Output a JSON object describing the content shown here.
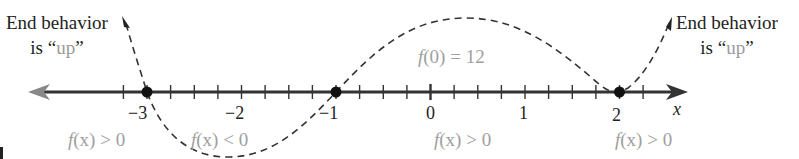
{
  "diagram": {
    "axis": {
      "variable": "x",
      "tick_labels": [
        "−3",
        "−2",
        "−1",
        "0",
        "1",
        "2"
      ],
      "tick_values": [
        -3,
        -2,
        -1,
        0,
        1,
        2
      ],
      "minor_ticks_per_unit": 4
    },
    "zeros": [
      -3,
      -1,
      2
    ],
    "left_end": {
      "line1": "End behavior",
      "line2_prefix": "is “",
      "line2_word": "up",
      "line2_suffix": "”"
    },
    "right_end": {
      "line1": "End behavior",
      "line2_prefix": "is “",
      "line2_word": "up",
      "line2_suffix": "”"
    },
    "y_intercept": {
      "fn": "f",
      "arg": "(0)",
      "rest": " = 12"
    },
    "regions": [
      {
        "fn": "f",
        "arg": "(x)",
        "rel": " > 0"
      },
      {
        "fn": "f",
        "arg": "(x)",
        "rel": " < 0"
      },
      {
        "fn": "f",
        "arg": "(x)",
        "rel": " > 0"
      },
      {
        "fn": "f",
        "arg": "(x)",
        "rel": " > 0"
      }
    ],
    "colors": {
      "axis": "#333333",
      "axis_arrow_left": "#888888",
      "curve": "#333333",
      "zero_dot": "#111111",
      "annotation_gray": "#a0a0a0",
      "text": "#222222"
    }
  }
}
